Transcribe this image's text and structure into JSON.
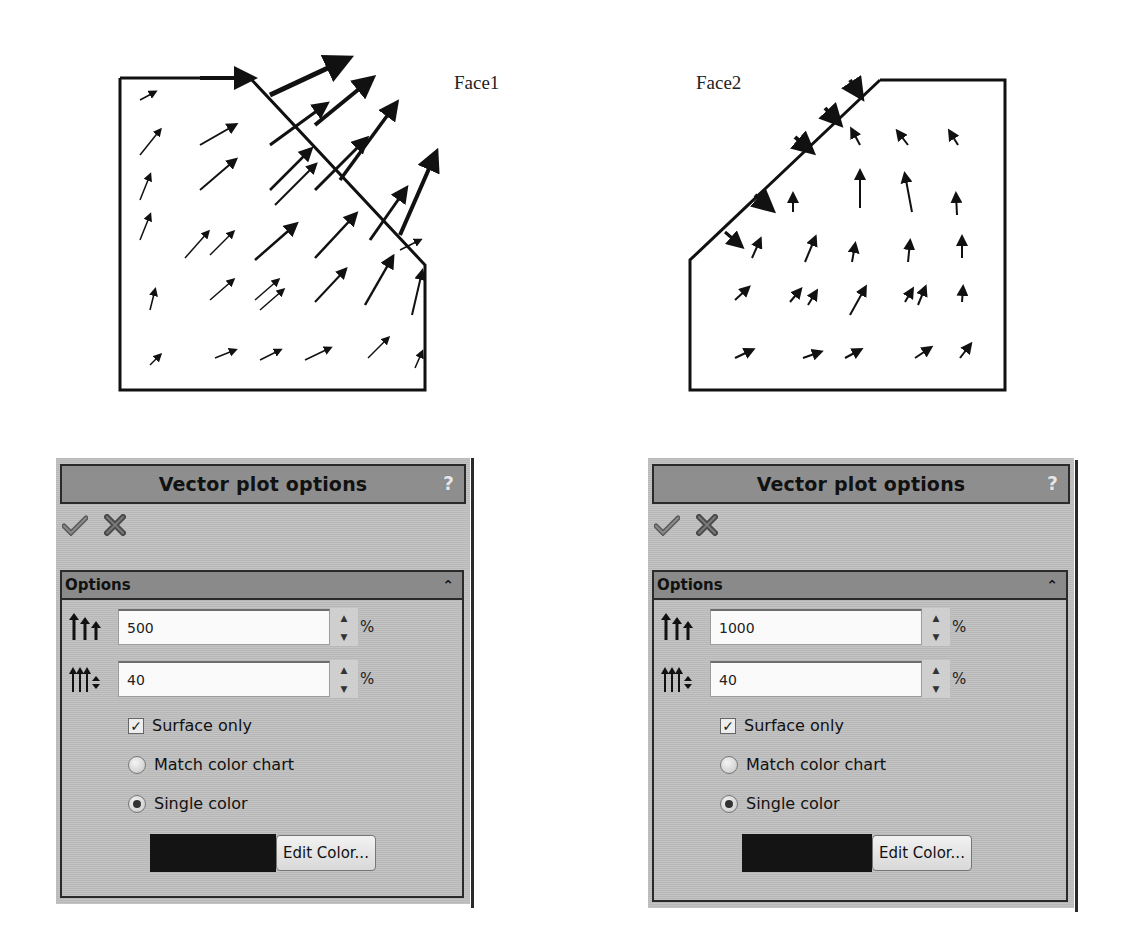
{
  "plots": [
    {
      "label": "Face1",
      "name": "face1-vector-plot"
    },
    {
      "label": "Face2",
      "name": "face2-vector-plot"
    }
  ],
  "panels": [
    {
      "title": "Vector plot options",
      "help": "?",
      "section_title": "Options",
      "size_value": "500",
      "size_unit": "%",
      "density_value": "40",
      "density_unit": "%",
      "surface_only_label": "Surface only",
      "surface_only_checked": true,
      "match_color_label": "Match color chart",
      "single_color_label": "Single color",
      "selected_color_mode": "single",
      "swatch_color": "#141414",
      "edit_color_label": "Edit Color..."
    },
    {
      "title": "Vector plot options",
      "help": "?",
      "section_title": "Options",
      "size_value": "1000",
      "size_unit": "%",
      "density_value": "40",
      "density_unit": "%",
      "surface_only_label": "Surface only",
      "surface_only_checked": true,
      "match_color_label": "Match color chart",
      "single_color_label": "Single color",
      "selected_color_mode": "single",
      "swatch_color": "#141414",
      "edit_color_label": "Edit Color..."
    }
  ],
  "icons": {
    "ok": "check-icon",
    "cancel": "x-icon",
    "collapse": "double-chevron-up-icon",
    "vector_size": "arrow-size-icon",
    "vector_density": "arrow-density-icon"
  }
}
